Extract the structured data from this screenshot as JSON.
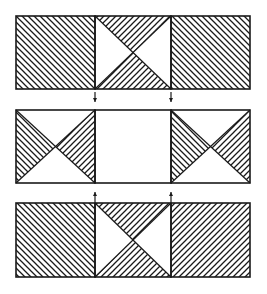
{
  "diagram": {
    "colors": {
      "ink": "#1a1a1a",
      "paper": "#ffffff"
    },
    "layout": {
      "x_left": 16,
      "x_div1": 95,
      "x_div2": 171,
      "x_right": 250,
      "rows": [
        {
          "id": "top",
          "y_top": 16,
          "y_bottom": 89
        },
        {
          "id": "middle",
          "y_top": 110,
          "y_bottom": 183
        },
        {
          "id": "bottom",
          "y_top": 203,
          "y_bottom": 277
        }
      ]
    },
    "rows": [
      {
        "id": "top",
        "panels": [
          {
            "type": "full",
            "hatch": "backslash"
          },
          {
            "type": "hourglass-vertical",
            "top": "slash",
            "bottom": "slash"
          },
          {
            "type": "full",
            "hatch": "backslash"
          }
        ]
      },
      {
        "id": "middle",
        "panels": [
          {
            "type": "bowtie-horizontal",
            "left": "backslash",
            "right": "slash"
          },
          {
            "type": "empty"
          },
          {
            "type": "bowtie-horizontal",
            "left": "backslash",
            "right": "slash"
          }
        ]
      },
      {
        "id": "bottom",
        "panels": [
          {
            "type": "full",
            "hatch": "backslash"
          },
          {
            "type": "hourglass-vertical",
            "top": "slash",
            "bottom": "slash"
          },
          {
            "type": "full",
            "hatch": "slash"
          }
        ]
      }
    ],
    "arrows": [
      {
        "direction": "down",
        "x": 95,
        "y1": 92,
        "y2": 102
      },
      {
        "direction": "down",
        "x": 171,
        "y1": 92,
        "y2": 102
      },
      {
        "direction": "up",
        "x": 95,
        "y1": 202,
        "y2": 192
      },
      {
        "direction": "up",
        "x": 171,
        "y1": 202,
        "y2": 192
      }
    ]
  }
}
